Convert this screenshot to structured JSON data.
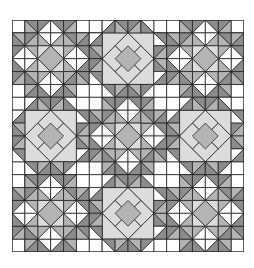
{
  "image": {
    "title": "Quilt pattern",
    "description": "18x18 grid quilt: 3x3 arrangement of 6x6 blocks; star blocks (A) at corners and center, light square-in-square blocks (B) on edges",
    "grid_size": 18,
    "block_size": 6,
    "layout": [
      [
        "A",
        "B",
        "A"
      ],
      [
        "B",
        "A",
        "B"
      ],
      [
        "A",
        "B",
        "A"
      ]
    ]
  },
  "colors": {
    "white": "#ffffff",
    "light": "#dcdcdc",
    "medium": "#b4b4b4",
    "dark": "#8c8c8c",
    "line": "#222222"
  }
}
